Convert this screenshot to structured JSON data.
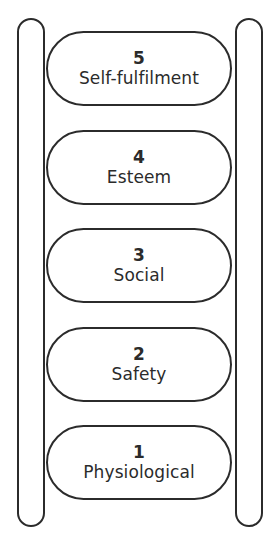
{
  "figure": {
    "name": "hierarchy-of-needs-ladder",
    "background_color": "#ffffff",
    "stroke_color": "#2b2b2b",
    "canvas": {
      "width": 276,
      "height": 557
    }
  },
  "ladder": {
    "rails": [
      {
        "side": "left",
        "name": "left-rail"
      },
      {
        "side": "right",
        "name": "right-rail"
      }
    ],
    "rungs": [
      {
        "level": "5",
        "label": "Self-fulfilment",
        "top": 31
      },
      {
        "level": "4",
        "label": "Esteem",
        "top": 130
      },
      {
        "level": "3",
        "label": "Social",
        "top": 228
      },
      {
        "level": "2",
        "label": "Safety",
        "top": 327
      },
      {
        "level": "1",
        "label": "Physiological",
        "top": 425
      }
    ]
  }
}
